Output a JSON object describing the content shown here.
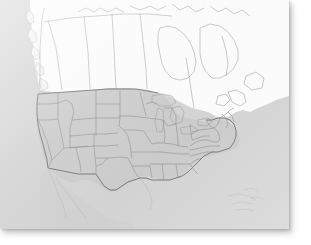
{
  "figure": {
    "kind": "map",
    "title": "North America reference map",
    "projection": "conic",
    "orientation": "north-up"
  },
  "card": {
    "name": "map-card",
    "x": 0,
    "y": 0,
    "width": 289,
    "height": 229,
    "background_color": "#d3d3d3",
    "shadow_color": "#787878"
  },
  "canvas": {
    "width": 311,
    "height": 245,
    "background_color": "#ffffff"
  },
  "palette": {
    "ocean": "#d3d3d3",
    "canada_fill": "#fbfbfb",
    "us_fill": "#cbcbcb",
    "mexico_fill": "#d0d0d0",
    "thin_border": "#9a9a9a",
    "state_border": "#8e8e8e",
    "country_outline": "#6e6e6e",
    "faint_coast": "#b4b4b4",
    "island_fill": "#f2f2f2"
  },
  "regions": {
    "canada": {
      "label": "Canada",
      "fill": "#fbfbfb",
      "provinces": [
        "British Columbia",
        "Alberta",
        "Saskatchewan",
        "Manitoba",
        "Ontario",
        "Quebec",
        "Newfoundland and Labrador",
        "New Brunswick",
        "Nova Scotia",
        "Yukon",
        "Northwest Territories",
        "Nunavut"
      ]
    },
    "united_states": {
      "label": "United States",
      "fill": "#cbcbcb",
      "states": [
        "Washington",
        "Oregon",
        "California",
        "Idaho",
        "Nevada",
        "Montana",
        "Wyoming",
        "Utah",
        "Arizona",
        "Colorado",
        "New Mexico",
        "North Dakota",
        "South Dakota",
        "Nebraska",
        "Kansas",
        "Oklahoma",
        "Texas",
        "Minnesota",
        "Iowa",
        "Missouri",
        "Arkansas",
        "Louisiana",
        "Wisconsin",
        "Illinois",
        "Michigan",
        "Indiana",
        "Ohio",
        "Kentucky",
        "Tennessee",
        "Mississippi",
        "Alabama",
        "Georgia",
        "Florida",
        "South Carolina",
        "North Carolina",
        "Virginia",
        "West Virginia",
        "Maryland",
        "Delaware",
        "Pennsylvania",
        "New York",
        "New Jersey",
        "Connecticut",
        "Rhode Island",
        "Massachusetts",
        "Vermont",
        "New Hampshire",
        "Maine"
      ]
    },
    "mexico": {
      "label": "Mexico",
      "fill": "#d0d0d0"
    },
    "water": {
      "label": "Ocean and lakes",
      "features": [
        "Pacific Ocean",
        "Atlantic Ocean",
        "Gulf of Mexico",
        "Hudson Bay",
        "Great Lakes"
      ]
    }
  },
  "chart_data": {
    "type": "map",
    "legend": [],
    "annotations": [],
    "grid": false
  }
}
